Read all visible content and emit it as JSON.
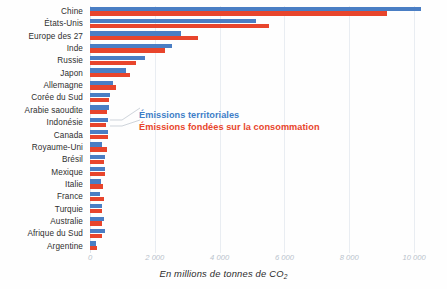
{
  "chart_data": {
    "type": "bar",
    "orientation": "horizontal",
    "title": "",
    "subtitle": "",
    "xlabel": "En millions de tonnes de CO2",
    "ylabel": "",
    "xlim": [
      0,
      10800
    ],
    "xticks": [
      0,
      2000,
      4000,
      6000,
      8000,
      10000
    ],
    "xtick_labels": [
      "0",
      "2 000",
      "4 000",
      "6 000",
      "8 000",
      "10 000"
    ],
    "grid": "vertical",
    "legend_position": "inside-middle-left",
    "categories": [
      "Chine",
      "États-Unis",
      "Europe des 27",
      "Inde",
      "Russie",
      "Japon",
      "Allemagne",
      "Corée du Sud",
      "Arabie saoudite",
      "Indonésie",
      "Canada",
      "Royaume-Uni",
      "Brésil",
      "Mexique",
      "Italie",
      "France",
      "Turquie",
      "Australie",
      "Afrique du Sud",
      "Argentine"
    ],
    "series": [
      {
        "name": "Émissions territoriales",
        "color": "#4a7ec4",
        "values": [
          10200,
          5120,
          2810,
          2540,
          1690,
          1120,
          700,
          620,
          600,
          560,
          560,
          370,
          460,
          460,
          330,
          310,
          380,
          420,
          450,
          190
        ]
      },
      {
        "name": "Émissions fondées sur la consommation",
        "color": "#e8452c",
        "values": [
          9170,
          5530,
          3340,
          2310,
          1420,
          1240,
          800,
          600,
          520,
          480,
          550,
          530,
          440,
          450,
          390,
          430,
          370,
          380,
          370,
          210
        ]
      }
    ]
  },
  "legend": {
    "entries": [
      {
        "label": "Émissions territoriales",
        "color": "#3f7ec8"
      },
      {
        "label": "Émissions fondées sur la consommation",
        "color": "#e8452c"
      }
    ]
  },
  "axis": {
    "caption_main": "En millions de tonnes de CO",
    "caption_sub": "2"
  }
}
